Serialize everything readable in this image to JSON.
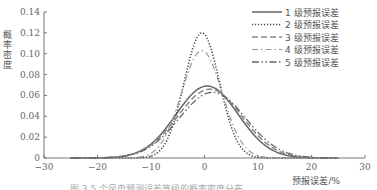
{
  "chart_data": {
    "type": "line",
    "title": "",
    "xlabel": "预报误差/%",
    "ylabel": "概率密度",
    "xlim": [
      -30,
      30
    ],
    "ylim": [
      0,
      0.14
    ],
    "x_ticks": [
      -30,
      -20,
      -10,
      0,
      10,
      20,
      30
    ],
    "x_tick_labels": [
      "−30",
      "−20",
      "−10",
      "0",
      "10",
      "20",
      "30"
    ],
    "y_ticks": [
      0,
      0.02,
      0.04,
      0.06,
      0.08,
      0.1,
      0.12,
      0.14
    ],
    "y_tick_labels": [
      "0",
      "0.02",
      "0.04",
      "0.06",
      "0.08",
      "0.10",
      "0.12",
      "0.14"
    ],
    "grid": false,
    "legend_position": "upper right",
    "series": [
      {
        "name": "1 级预报误差",
        "style": "solid",
        "mean": 0.5,
        "sigma": 5.8,
        "peak": 0.069
      },
      {
        "name": "2 级预报误差",
        "style": "dotted",
        "mean": -0.5,
        "sigma": 3.3,
        "peak": 0.12
      },
      {
        "name": "3 级预报误差",
        "style": "dashed",
        "mean": 1.0,
        "sigma": 6.0,
        "peak": 0.066
      },
      {
        "name": "4 级预报误差",
        "style": "dash-dot",
        "mean": -0.5,
        "sigma": 3.8,
        "peak": 0.103
      },
      {
        "name": "5 级预报误差",
        "style": "dash-dot-dot",
        "mean": 1.5,
        "sigma": 6.2,
        "peak": 0.063
      }
    ]
  },
  "caption": "图 3  5 个风电预测误差等级的概率密度分布"
}
